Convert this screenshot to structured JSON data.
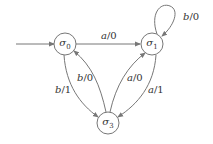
{
  "diagram": {
    "type": "finite-state-machine",
    "colors": {
      "stroke": "#777777",
      "text": "#333333",
      "background": "#ffffff"
    },
    "states": [
      {
        "id": "s0",
        "symbol": "σ",
        "subscript": "0",
        "initial": true
      },
      {
        "id": "s1",
        "symbol": "σ",
        "subscript": "1",
        "initial": false
      },
      {
        "id": "s3",
        "symbol": "σ",
        "subscript": "3",
        "initial": false
      }
    ],
    "transitions": [
      {
        "from": "s0",
        "to": "s1",
        "input": "a",
        "output": "/0"
      },
      {
        "from": "s1",
        "to": "s1",
        "input": "b",
        "output": "/0"
      },
      {
        "from": "s0",
        "to": "s3",
        "input": "b",
        "output": "/1"
      },
      {
        "from": "s3",
        "to": "s0",
        "input": "b",
        "output": "/0"
      },
      {
        "from": "s3",
        "to": "s1",
        "input": "a",
        "output": "/0"
      },
      {
        "from": "s1",
        "to": "s3",
        "input": "a",
        "output": "/1"
      }
    ]
  }
}
